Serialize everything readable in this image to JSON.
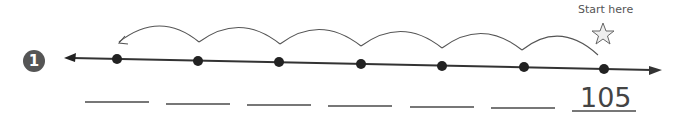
{
  "problem": {
    "number": "1",
    "start_label": "Start here",
    "start_value": "105",
    "point_count": 7,
    "hops": 6,
    "hop_direction": "left",
    "blanks": [
      "",
      "",
      "",
      "",
      "",
      ""
    ],
    "colors": {
      "line": "#333333",
      "point": "#222222",
      "badge": "#555555",
      "star_fill": "#eeeeee"
    }
  }
}
